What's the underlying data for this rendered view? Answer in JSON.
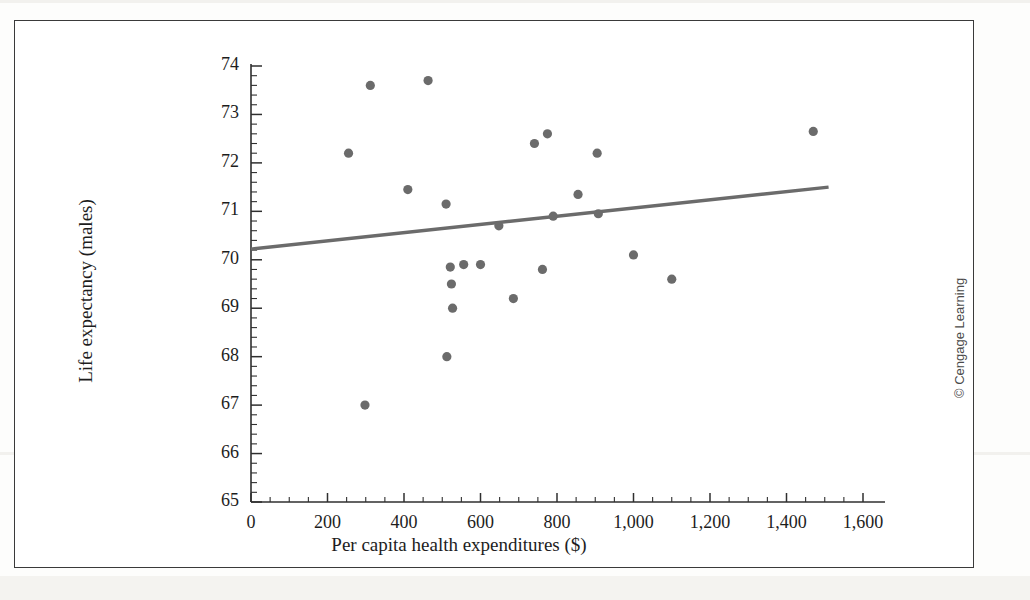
{
  "figure": {
    "credit": "© Cengage Learning",
    "frame_color": "#3a3a3a",
    "marker_color": "#6b6b6b",
    "line_color": "#6b6b6b",
    "background": "#ffffff"
  },
  "chart_data": {
    "type": "scatter",
    "title": "",
    "xlabel": "Per capita health expenditures ($)",
    "ylabel": "Life expectancy (males)",
    "xlim": [
      0,
      1600
    ],
    "ylim": [
      65,
      74
    ],
    "xticks": [
      0,
      200,
      400,
      600,
      800,
      1000,
      1200,
      1400,
      1600
    ],
    "xtick_labels": [
      "0",
      "200",
      "400",
      "600",
      "800",
      "1,000",
      "1,200",
      "1,400",
      "1,600"
    ],
    "yticks": [
      65,
      66,
      67,
      68,
      69,
      70,
      71,
      72,
      73,
      74
    ],
    "ytick_labels": [
      "65",
      "66",
      "67",
      "68",
      "69",
      "70",
      "71",
      "72",
      "73",
      "74"
    ],
    "x_minor_step": 50,
    "y_minor_step": 0.2,
    "grid": false,
    "legend": null,
    "points": [
      {
        "x": 255,
        "y": 72.2
      },
      {
        "x": 298,
        "y": 67.0
      },
      {
        "x": 312,
        "y": 73.6
      },
      {
        "x": 410,
        "y": 71.45
      },
      {
        "x": 463,
        "y": 73.7
      },
      {
        "x": 510,
        "y": 71.15
      },
      {
        "x": 512,
        "y": 68.0
      },
      {
        "x": 521,
        "y": 69.85
      },
      {
        "x": 524,
        "y": 69.5
      },
      {
        "x": 527,
        "y": 69.0
      },
      {
        "x": 556,
        "y": 69.9
      },
      {
        "x": 600,
        "y": 69.9
      },
      {
        "x": 648,
        "y": 70.7
      },
      {
        "x": 686,
        "y": 69.2
      },
      {
        "x": 741,
        "y": 72.4
      },
      {
        "x": 762,
        "y": 69.8
      },
      {
        "x": 775,
        "y": 72.6
      },
      {
        "x": 790,
        "y": 70.9
      },
      {
        "x": 855,
        "y": 71.35
      },
      {
        "x": 905,
        "y": 72.2
      },
      {
        "x": 908,
        "y": 70.95
      },
      {
        "x": 1000,
        "y": 70.1
      },
      {
        "x": 1100,
        "y": 69.6
      },
      {
        "x": 1470,
        "y": 72.65
      }
    ],
    "trendline": {
      "type": "linear-regression",
      "x_start": 0,
      "y_start": 70.22,
      "x_end": 1510,
      "y_end": 71.5
    }
  }
}
